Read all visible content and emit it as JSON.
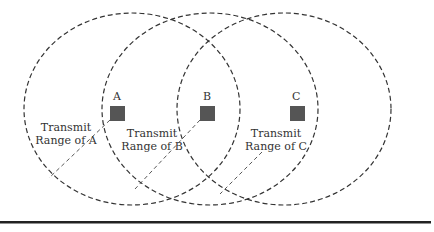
{
  "diagram": {
    "type": "transmit-range-overlap",
    "nodes": [
      {
        "id": "A",
        "label": "A",
        "range_label_line1": "Transmit",
        "range_label_line2": "Range of A"
      },
      {
        "id": "B",
        "label": "B",
        "range_label_line1": "Transmit",
        "range_label_line2": "Range of B"
      },
      {
        "id": "C",
        "label": "C",
        "range_label_line1": "Transmit",
        "range_label_line2": "Range of C"
      }
    ],
    "colors": {
      "node_fill": "#555555",
      "circle_stroke": "#333333",
      "rule": "#222222"
    }
  }
}
